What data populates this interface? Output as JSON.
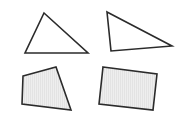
{
  "colors": {
    "background": "#ffffff",
    "stroke": "#2b2b2b",
    "fill_empty": "#ffffff",
    "fill_shaded": "#eeeeee",
    "hatch": "#dcdcdc"
  },
  "shapes": [
    {
      "id": "triangle-top-left",
      "type": "triangle",
      "filled": false,
      "points": [
        [
          44,
          13
        ],
        [
          88,
          53
        ],
        [
          25,
          53
        ]
      ]
    },
    {
      "id": "triangle-top-right",
      "type": "triangle",
      "filled": false,
      "points": [
        [
          107,
          12
        ],
        [
          172,
          46
        ],
        [
          111,
          51
        ]
      ]
    },
    {
      "id": "quadrilateral-bottom-left",
      "type": "quadrilateral",
      "filled": true,
      "points": [
        [
          23,
          76
        ],
        [
          56,
          67
        ],
        [
          71,
          110
        ],
        [
          22,
          104
        ]
      ]
    },
    {
      "id": "quadrilateral-bottom-right",
      "type": "quadrilateral",
      "filled": true,
      "points": [
        [
          103,
          67
        ],
        [
          157,
          74
        ],
        [
          153,
          110
        ],
        [
          99,
          104
        ]
      ]
    }
  ]
}
